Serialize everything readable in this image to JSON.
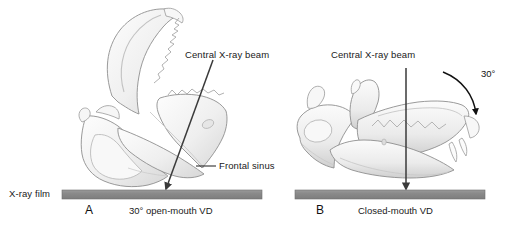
{
  "figure": {
    "background_color": "#ffffff",
    "width": 505,
    "height": 225,
    "film_color": "#8a8a8a",
    "bone_fill": "#f2f2f2",
    "bone_stroke": "#8c8c8c",
    "arrow_color": "#3a3a3a",
    "text_color": "#1a1a1a"
  },
  "film_label": {
    "text": "X-ray film"
  },
  "panel_a": {
    "letter": "A",
    "caption": "30° open-mouth VD",
    "beam_label": "Central X-ray beam",
    "sinus_label": "Frontal sinus",
    "anatomy_name": "open-mouth-skull"
  },
  "panel_b": {
    "letter": "B",
    "caption": "Closed-mouth VD",
    "beam_label": "Central X-ray beam",
    "angle_label": "30°",
    "anatomy_name": "closed-mouth-skull"
  }
}
